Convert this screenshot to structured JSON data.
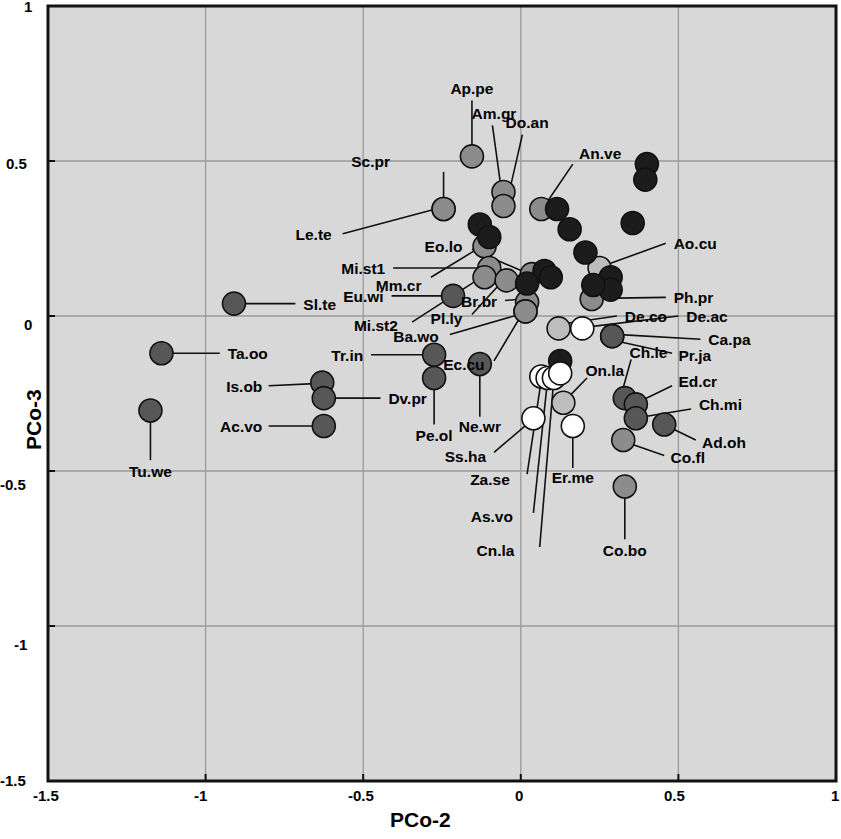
{
  "chart_data": {
    "type": "scatter",
    "title": "",
    "xlabel": "PCo-2",
    "ylabel": "PCo-3",
    "xlim": [
      -1.5,
      1
    ],
    "ylim": [
      -1.5,
      1
    ],
    "xticks": [
      "-1.5",
      "-1",
      "-0.5",
      "0",
      "0.5",
      "1"
    ],
    "xtickvals": [
      -1.5,
      -1,
      -0.5,
      0,
      0.5,
      1
    ],
    "yticks": [
      "1",
      "0.5",
      "0",
      "-0.5",
      "-1",
      "-1.5"
    ],
    "ytickvals": [
      1,
      0.5,
      0,
      -0.5,
      -1,
      -1.5
    ],
    "grid": true,
    "legend": "none",
    "plot_background": "#d8d8d8",
    "shade_levels": {
      "black": "#1c1c1c",
      "dark": "#575757",
      "medium": "#8c8c8c",
      "light": "#bdbdbd",
      "white": "#ffffff"
    },
    "points": [
      {
        "label": "Sl.te",
        "x": -0.91,
        "y": 0.04,
        "shade": "dark",
        "lx": -0.69,
        "ly": 0.04,
        "anchor": "start",
        "leader": [
          [
            -0.885,
            0.04
          ],
          [
            -0.715,
            0.04
          ]
        ]
      },
      {
        "label": "Ta.oo",
        "x": -1.14,
        "y": -0.12,
        "shade": "dark",
        "lx": -0.93,
        "ly": -0.12,
        "anchor": "start",
        "leader": [
          [
            -1.115,
            -0.12
          ],
          [
            -0.955,
            -0.12
          ]
        ]
      },
      {
        "label": "Is.ob",
        "x": -0.63,
        "y": -0.215,
        "shade": "dark",
        "lx": -0.82,
        "ly": -0.225,
        "anchor": "end",
        "leader": [
          [
            -0.655,
            -0.218
          ],
          [
            -0.8,
            -0.225
          ]
        ]
      },
      {
        "label": "Dv.pr",
        "x": -0.625,
        "y": -0.265,
        "shade": "dark",
        "lx": -0.42,
        "ly": -0.265,
        "anchor": "start",
        "leader": [
          [
            -0.6,
            -0.265
          ],
          [
            -0.445,
            -0.265
          ]
        ]
      },
      {
        "label": "Ac.vo",
        "x": -0.625,
        "y": -0.355,
        "shade": "dark",
        "lx": -0.82,
        "ly": -0.355,
        "anchor": "end",
        "leader": [
          [
            -0.65,
            -0.355
          ],
          [
            -0.8,
            -0.355
          ]
        ]
      },
      {
        "label": "Tu.we",
        "x": -1.175,
        "y": -0.305,
        "shade": "dark",
        "lx": -1.175,
        "ly": -0.5,
        "anchor": "middle",
        "leader": [
          [
            -1.175,
            -0.33
          ],
          [
            -1.175,
            -0.465
          ]
        ]
      },
      {
        "label": "Sc.pr",
        "x": -0.245,
        "y": 0.345,
        "shade": "medium",
        "lx": -0.415,
        "ly": 0.5,
        "anchor": "end",
        "leader": [
          [
            -0.245,
            0.32
          ],
          [
            -0.245,
            0.465
          ]
        ]
      },
      {
        "label": "Le.te",
        "x": -0.245,
        "y": 0.345,
        "shade": "medium",
        "lx": -0.6,
        "ly": 0.265,
        "anchor": "end",
        "leader": [
          [
            -0.27,
            0.345
          ],
          [
            -0.565,
            0.265
          ]
        ]
      },
      {
        "label": "Ap.pe",
        "x": -0.155,
        "y": 0.515,
        "shade": "medium",
        "lx": -0.155,
        "ly": 0.735,
        "anchor": "middle",
        "leader": [
          [
            -0.155,
            0.545
          ],
          [
            -0.155,
            0.695
          ]
        ]
      },
      {
        "label": "Am.gr",
        "x": -0.055,
        "y": 0.4,
        "shade": "medium",
        "lx": -0.085,
        "ly": 0.655,
        "anchor": "middle",
        "leader": [
          [
            -0.065,
            0.43
          ],
          [
            -0.09,
            0.615
          ]
        ]
      },
      {
        "label": "Do.an",
        "x": -0.055,
        "y": 0.355,
        "shade": "medium",
        "lx": 0.02,
        "ly": 0.625,
        "anchor": "middle",
        "leader": [
          [
            -0.04,
            0.385
          ],
          [
            0.005,
            0.585
          ]
        ]
      },
      {
        "label": "An.ve",
        "x": 0.065,
        "y": 0.345,
        "shade": "medium",
        "lx": 0.185,
        "ly": 0.525,
        "anchor": "start",
        "leader": [
          [
            0.085,
            0.37
          ],
          [
            0.165,
            0.49
          ]
        ]
      },
      {
        "label": "Mm.cr",
        "x": -0.115,
        "y": 0.225,
        "shade": "medium",
        "lx": -0.315,
        "ly": 0.1,
        "anchor": "end",
        "leader": [
          [
            -0.14,
            0.215
          ],
          [
            -0.285,
            0.125
          ]
        ]
      },
      {
        "label": "Mi.st1",
        "x": -0.1,
        "y": 0.155,
        "shade": "medium",
        "lx": -0.43,
        "ly": 0.155,
        "anchor": "end",
        "leader": [
          [
            -0.125,
            0.155
          ],
          [
            -0.405,
            0.155
          ]
        ]
      },
      {
        "label": "Eu.wi",
        "x": -0.215,
        "y": 0.065,
        "shade": "dark",
        "lx": -0.435,
        "ly": 0.065,
        "anchor": "end",
        "leader": [
          [
            -0.24,
            0.065
          ],
          [
            -0.41,
            0.065
          ]
        ]
      },
      {
        "label": "Mi.st2",
        "x": -0.115,
        "y": 0.125,
        "shade": "medium",
        "lx": -0.39,
        "ly": -0.03,
        "anchor": "end",
        "leader": [
          [
            -0.14,
            0.115
          ],
          [
            -0.345,
            -0.02
          ]
        ]
      },
      {
        "label": "Pl.ly",
        "x": -0.045,
        "y": 0.115,
        "shade": "medium",
        "lx": -0.185,
        "ly": -0.005,
        "anchor": "end",
        "leader": [
          [
            -0.065,
            0.105
          ],
          [
            -0.155,
            0.005
          ]
        ]
      },
      {
        "label": "Eo.lo",
        "x": 0.035,
        "y": 0.135,
        "shade": "medium",
        "lx": -0.185,
        "ly": 0.225,
        "anchor": "end",
        "leader": [
          [
            0.015,
            0.14
          ],
          [
            -0.155,
            0.215
          ]
        ]
      },
      {
        "label": "Br.br",
        "x": 0.02,
        "y": 0.045,
        "shade": "medium",
        "lx": -0.075,
        "ly": 0.05,
        "anchor": "end",
        "leader": [
          [
            0.005,
            0.055
          ],
          [
            -0.05,
            0.05
          ]
        ]
      },
      {
        "label": "Ba.wo",
        "x": 0.015,
        "y": 0.015,
        "shade": "medium",
        "lx": -0.26,
        "ly": -0.065,
        "anchor": "end",
        "leader": [
          [
            -0.005,
            0.005
          ],
          [
            -0.225,
            -0.06
          ]
        ]
      },
      {
        "label": "Ec.cu",
        "x": 0.015,
        "y": 0.015,
        "shade": "medium",
        "lx": -0.115,
        "ly": -0.155,
        "anchor": "end",
        "leader": [
          [
            0.0,
            0.0
          ],
          [
            -0.085,
            -0.145
          ]
        ]
      },
      {
        "label": "Ao.cu",
        "x": 0.25,
        "y": 0.155,
        "shade": "light",
        "lx": 0.485,
        "ly": 0.235,
        "anchor": "start",
        "leader": [
          [
            0.272,
            0.165
          ],
          [
            0.46,
            0.235
          ]
        ]
      },
      {
        "label": "Ph.pr",
        "x": 0.225,
        "y": 0.055,
        "shade": "medium",
        "lx": 0.485,
        "ly": 0.06,
        "anchor": "start",
        "leader": [
          [
            0.25,
            0.057
          ],
          [
            0.46,
            0.06
          ]
        ]
      },
      {
        "label": "De.co",
        "x": 0.12,
        "y": -0.04,
        "shade": "light",
        "lx": 0.33,
        "ly": 0.0,
        "anchor": "start",
        "leader": [
          [
            0.135,
            -0.025
          ],
          [
            0.305,
            0.0
          ]
        ]
      },
      {
        "label": "De.ac",
        "x": 0.195,
        "y": -0.04,
        "shade": "white",
        "lx": 0.525,
        "ly": 0.0,
        "anchor": "start",
        "leader": [
          [
            0.215,
            -0.035
          ],
          [
            0.5,
            0.0
          ]
        ]
      },
      {
        "label": "Ca.pa",
        "x": 0.29,
        "y": -0.065,
        "shade": "dark",
        "lx": 0.595,
        "ly": -0.075,
        "anchor": "start",
        "leader": [
          [
            0.315,
            -0.06
          ],
          [
            0.57,
            -0.075
          ]
        ]
      },
      {
        "label": "Pr.ja",
        "x": 0.29,
        "y": -0.065,
        "shade": "dark",
        "lx": 0.5,
        "ly": -0.125,
        "anchor": "start",
        "leader": [
          [
            0.31,
            -0.082
          ],
          [
            0.48,
            -0.12
          ]
        ]
      },
      {
        "label": "Ch.le",
        "x": 0.33,
        "y": -0.265,
        "shade": "dark",
        "lx": 0.345,
        "ly": -0.115,
        "anchor": "start",
        "leader": [
          [
            0.322,
            -0.242
          ],
          [
            0.35,
            -0.14
          ]
        ]
      },
      {
        "label": "Ed.cr",
        "x": 0.365,
        "y": -0.285,
        "shade": "dark",
        "lx": 0.5,
        "ly": -0.21,
        "anchor": "start",
        "leader": [
          [
            0.385,
            -0.272
          ],
          [
            0.48,
            -0.225
          ]
        ]
      },
      {
        "label": "Ch.mi",
        "x": 0.365,
        "y": -0.33,
        "shade": "dark",
        "lx": 0.565,
        "ly": -0.285,
        "anchor": "start",
        "leader": [
          [
            0.39,
            -0.325
          ],
          [
            0.54,
            -0.3
          ]
        ]
      },
      {
        "label": "Ad.oh",
        "x": 0.455,
        "y": -0.35,
        "shade": "dark",
        "lx": 0.575,
        "ly": -0.405,
        "anchor": "start",
        "leader": [
          [
            0.478,
            -0.362
          ],
          [
            0.555,
            -0.4
          ]
        ]
      },
      {
        "label": "Co.fl",
        "x": 0.325,
        "y": -0.4,
        "shade": "medium",
        "lx": 0.475,
        "ly": -0.455,
        "anchor": "start",
        "leader": [
          [
            0.348,
            -0.412
          ],
          [
            0.455,
            -0.45
          ]
        ]
      },
      {
        "label": "Co.bo",
        "x": 0.33,
        "y": -0.55,
        "shade": "medium",
        "lx": 0.33,
        "ly": -0.755,
        "anchor": "middle",
        "leader": [
          [
            0.33,
            -0.575
          ],
          [
            0.33,
            -0.72
          ]
        ]
      },
      {
        "label": "On.la",
        "x": 0.135,
        "y": -0.28,
        "shade": "light",
        "lx": 0.205,
        "ly": -0.175,
        "anchor": "start",
        "leader": [
          [
            0.148,
            -0.265
          ],
          [
            0.21,
            -0.2
          ]
        ]
      },
      {
        "label": "Er.me",
        "x": 0.165,
        "y": -0.355,
        "shade": "white",
        "lx": 0.165,
        "ly": -0.52,
        "anchor": "middle",
        "leader": [
          [
            0.165,
            -0.378
          ],
          [
            0.165,
            -0.49
          ]
        ]
      },
      {
        "label": "Ss.ha",
        "x": 0.04,
        "y": -0.33,
        "shade": "white",
        "lx": -0.11,
        "ly": -0.45,
        "anchor": "end",
        "leader": [
          [
            0.025,
            -0.345
          ],
          [
            -0.085,
            -0.44
          ]
        ]
      },
      {
        "label": "Za.se",
        "x": 0.065,
        "y": -0.195,
        "shade": "white",
        "lx": -0.035,
        "ly": -0.525,
        "anchor": "end",
        "leader": [
          [
            0.063,
            -0.22
          ],
          [
            0.02,
            -0.51
          ]
        ]
      },
      {
        "label": "As.vo",
        "x": 0.085,
        "y": -0.2,
        "shade": "white",
        "lx": -0.025,
        "ly": -0.645,
        "anchor": "end",
        "leader": [
          [
            0.083,
            -0.225
          ],
          [
            0.04,
            -0.635
          ]
        ]
      },
      {
        "label": "Cn.la",
        "x": 0.105,
        "y": -0.2,
        "shade": "white",
        "lx": -0.02,
        "ly": -0.755,
        "anchor": "end",
        "leader": [
          [
            0.103,
            -0.225
          ],
          [
            0.06,
            -0.745
          ]
        ]
      },
      {
        "label": "Tr.in",
        "x": -0.275,
        "y": -0.125,
        "shade": "dark",
        "lx": -0.5,
        "ly": -0.125,
        "anchor": "end",
        "leader": [
          [
            -0.3,
            -0.125
          ],
          [
            -0.475,
            -0.125
          ]
        ]
      },
      {
        "label": "Pe.ol",
        "x": -0.275,
        "y": -0.2,
        "shade": "dark",
        "lx": -0.275,
        "ly": -0.385,
        "anchor": "middle",
        "leader": [
          [
            -0.275,
            -0.225
          ],
          [
            -0.275,
            -0.35
          ]
        ]
      },
      {
        "label": "Ne.wr",
        "x": -0.13,
        "y": -0.155,
        "shade": "dark",
        "lx": -0.13,
        "ly": -0.355,
        "anchor": "middle",
        "leader": [
          [
            -0.13,
            -0.18
          ],
          [
            -0.13,
            -0.325
          ]
        ]
      },
      {
        "label": "",
        "x": 0.4,
        "y": 0.49,
        "shade": "black",
        "lx": null,
        "ly": null,
        "anchor": "middle",
        "leader": null
      },
      {
        "label": "",
        "x": 0.395,
        "y": 0.44,
        "shade": "black",
        "lx": null,
        "ly": null,
        "anchor": "middle",
        "leader": null
      },
      {
        "label": "",
        "x": 0.355,
        "y": 0.3,
        "shade": "black",
        "lx": null,
        "ly": null,
        "anchor": "middle",
        "leader": null
      },
      {
        "label": "",
        "x": 0.115,
        "y": 0.345,
        "shade": "black",
        "lx": null,
        "ly": null,
        "anchor": "middle",
        "leader": null
      },
      {
        "label": "",
        "x": 0.155,
        "y": 0.28,
        "shade": "black",
        "lx": null,
        "ly": null,
        "anchor": "middle",
        "leader": null
      },
      {
        "label": "",
        "x": -0.13,
        "y": 0.295,
        "shade": "black",
        "lx": null,
        "ly": null,
        "anchor": "middle",
        "leader": null
      },
      {
        "label": "",
        "x": -0.1,
        "y": 0.255,
        "shade": "black",
        "lx": null,
        "ly": null,
        "anchor": "middle",
        "leader": null
      },
      {
        "label": "",
        "x": 0.205,
        "y": 0.205,
        "shade": "black",
        "lx": null,
        "ly": null,
        "anchor": "middle",
        "leader": null
      },
      {
        "label": "",
        "x": 0.075,
        "y": 0.145,
        "shade": "black",
        "lx": null,
        "ly": null,
        "anchor": "middle",
        "leader": null
      },
      {
        "label": "",
        "x": 0.095,
        "y": 0.125,
        "shade": "black",
        "lx": null,
        "ly": null,
        "anchor": "middle",
        "leader": null
      },
      {
        "label": "",
        "x": 0.285,
        "y": 0.125,
        "shade": "black",
        "lx": null,
        "ly": null,
        "anchor": "middle",
        "leader": null
      },
      {
        "label": "",
        "x": 0.285,
        "y": 0.085,
        "shade": "black",
        "lx": null,
        "ly": null,
        "anchor": "middle",
        "leader": null
      },
      {
        "label": "",
        "x": 0.02,
        "y": 0.105,
        "shade": "black",
        "lx": null,
        "ly": null,
        "anchor": "middle",
        "leader": null
      },
      {
        "label": "",
        "x": 0.23,
        "y": 0.1,
        "shade": "black",
        "lx": null,
        "ly": null,
        "anchor": "middle",
        "leader": null
      },
      {
        "label": "",
        "x": 0.125,
        "y": -0.145,
        "shade": "black",
        "lx": null,
        "ly": null,
        "anchor": "middle",
        "leader": null
      },
      {
        "label": "",
        "x": 0.125,
        "y": -0.185,
        "shade": "white",
        "lx": null,
        "ly": null,
        "anchor": "middle",
        "leader": null
      }
    ]
  }
}
